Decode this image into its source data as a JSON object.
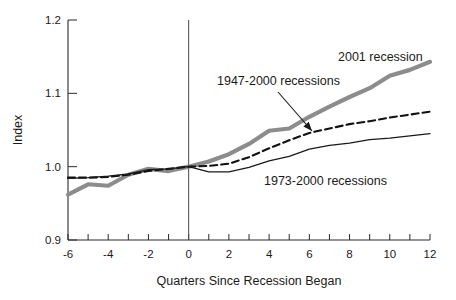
{
  "chart_data": {
    "type": "line",
    "title": "",
    "xlabel": "Quarters Since Recession Began",
    "ylabel": "Index",
    "xlim": [
      -6,
      12
    ],
    "ylim": [
      0.9,
      1.2
    ],
    "xticks": [
      -6,
      -5,
      -4,
      -3,
      -2,
      -1,
      0,
      1,
      2,
      3,
      4,
      5,
      6,
      7,
      8,
      9,
      10,
      11,
      12
    ],
    "xtick_labels": [
      "-6",
      "",
      "-4",
      "",
      "-2",
      "",
      "0",
      "",
      "2",
      "",
      "4",
      "",
      "6",
      "",
      "8",
      "",
      "10",
      "",
      "12"
    ],
    "yticks": [
      0.9,
      1.0,
      1.1,
      1.2
    ],
    "ytick_labels": [
      "0.9",
      "1.0",
      "1.1",
      "1.2"
    ],
    "grid": false,
    "legend_position": "inline-annotations",
    "reference_line_x": 0,
    "x": [
      -6,
      -5,
      -4,
      -3,
      -2,
      -1,
      0,
      1,
      2,
      3,
      4,
      5,
      6,
      7,
      8,
      9,
      10,
      11,
      12
    ],
    "series": [
      {
        "name": "2001 recession",
        "style": "thick-gray",
        "color": "#8c8c8c",
        "width": 4.2,
        "dash": "",
        "values": [
          0.962,
          0.976,
          0.974,
          0.989,
          0.997,
          0.994,
          1.0,
          1.007,
          1.017,
          1.031,
          1.049,
          1.052,
          1.068,
          1.082,
          1.095,
          1.107,
          1.124,
          1.132,
          1.143
        ]
      },
      {
        "name": "1947-2000 recessions",
        "style": "dashed-black",
        "color": "#111111",
        "width": 2.1,
        "dash": "7,4",
        "values": [
          0.985,
          0.985,
          0.986,
          0.989,
          0.994,
          0.997,
          1.0,
          1.001,
          1.004,
          1.013,
          1.025,
          1.036,
          1.046,
          1.052,
          1.058,
          1.062,
          1.067,
          1.071,
          1.075
        ]
      },
      {
        "name": "1973-2000 recessions",
        "style": "thin-black",
        "color": "#1a1a1a",
        "width": 1.3,
        "dash": "",
        "values": [
          0.984,
          0.985,
          0.987,
          0.99,
          0.996,
          0.997,
          1.0,
          0.993,
          0.993,
          0.999,
          1.008,
          1.014,
          1.024,
          1.029,
          1.032,
          1.037,
          1.039,
          1.042,
          1.045
        ]
      }
    ],
    "annotations": [
      {
        "name": "annotation-2001-recession",
        "text": "2001 recession",
        "x_px": 338,
        "y_px": 61,
        "anchor": "start",
        "arrow": null
      },
      {
        "name": "annotation-1947-2000-recessions",
        "text": "1947-2000 recessions",
        "x_px": 217,
        "y_px": 85,
        "anchor": "start",
        "arrow": {
          "x1": 278,
          "y1": 92,
          "x2": 312,
          "y2": 131
        }
      },
      {
        "name": "annotation-1973-2000-recessions",
        "text": "1973-2000 recessions",
        "x_px": 264,
        "y_px": 185,
        "anchor": "start",
        "arrow": null
      }
    ]
  }
}
